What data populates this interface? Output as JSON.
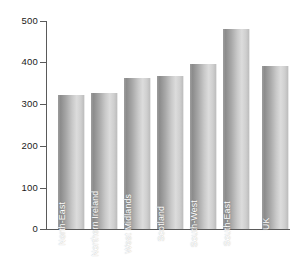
{
  "chart_data": {
    "type": "bar",
    "title": "",
    "subtitle": "",
    "xlabel": "",
    "ylabel": "",
    "categories": [
      "North-East",
      "Northern Ireland",
      "West Midlands",
      "Scotland",
      "South-West",
      "South-East",
      "UK"
    ],
    "values": [
      323,
      328,
      363,
      368,
      397,
      481,
      392
    ],
    "ylim": [
      0,
      500
    ],
    "ytick_labels": [
      "0",
      "100",
      "200",
      "300",
      "400",
      "500"
    ],
    "ytick_values": [
      0,
      100,
      200,
      300,
      400,
      500
    ],
    "grid": false,
    "legend": null,
    "legend_position": "none",
    "annotations": [],
    "colors": {
      "bar_dark": "#8c8c8c",
      "bar_light": "#dcdcdc",
      "axis": "#5a5a5a",
      "label_text": "#ffffff",
      "tick_text": "#1a1a1a",
      "background": "#ffffff"
    }
  }
}
